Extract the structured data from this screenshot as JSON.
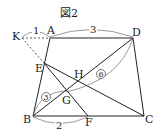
{
  "figure": {
    "title": "図2",
    "points": {
      "K": "K",
      "A": "A",
      "D": "D",
      "E": "E",
      "H": "H",
      "G": "G",
      "B": "B",
      "F": "F",
      "C": "C"
    },
    "measures": {
      "KA": "1",
      "AD": "3",
      "BF": "2",
      "BG": "3",
      "GD": "6"
    }
  }
}
